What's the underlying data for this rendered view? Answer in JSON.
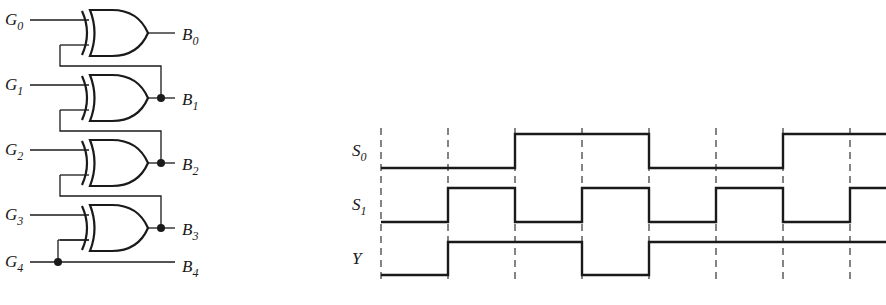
{
  "circuit": {
    "title": "Gray-to-binary converter",
    "inputs": [
      {
        "name": "G",
        "sub": "0",
        "y": 20
      },
      {
        "name": "G",
        "sub": "1",
        "y": 85
      },
      {
        "name": "G",
        "sub": "2",
        "y": 150
      },
      {
        "name": "G",
        "sub": "3",
        "y": 215
      },
      {
        "name": "G",
        "sub": "4",
        "y": 262
      }
    ],
    "outputs": [
      {
        "name": "B",
        "sub": "0",
        "y": 35
      },
      {
        "name": "B",
        "sub": "1",
        "y": 98
      },
      {
        "name": "B",
        "sub": "2",
        "y": 163
      },
      {
        "name": "B",
        "sub": "3",
        "y": 228
      },
      {
        "name": "B",
        "sub": "4",
        "y": 262
      }
    ],
    "gate_type": "XOR",
    "gate_count": 4
  },
  "timing": {
    "signals": [
      {
        "name": "S",
        "sub": "0",
        "high_y": 134,
        "low_y": 168,
        "levels": [
          0,
          0,
          1,
          1,
          0,
          0,
          1,
          1
        ]
      },
      {
        "name": "S",
        "sub": "1",
        "high_y": 188,
        "low_y": 222,
        "levels": [
          0,
          1,
          0,
          1,
          0,
          1,
          0,
          1
        ]
      },
      {
        "name": "Y",
        "sub": "",
        "high_y": 242,
        "low_y": 275,
        "levels": [
          0,
          1,
          1,
          0,
          1,
          1,
          1,
          1
        ]
      }
    ],
    "edges_x": [
      381,
      448,
      515,
      582,
      649,
      716,
      783,
      850,
      886
    ]
  }
}
